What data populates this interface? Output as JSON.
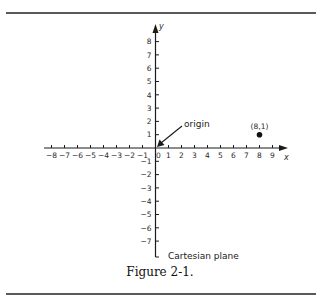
{
  "chart_data": {
    "type": "scatter",
    "title": "Cartesian plane",
    "caption": "Figure 2-1.",
    "xlabel": "x",
    "ylabel": "y",
    "xlim": [
      -8,
      9
    ],
    "ylim": [
      -8,
      8
    ],
    "x_ticks": [
      -8,
      -7,
      -6,
      -5,
      -4,
      -3,
      -2,
      -1,
      0,
      1,
      2,
      3,
      4,
      5,
      6,
      7,
      8,
      9
    ],
    "y_ticks": [
      -7,
      -6,
      -5,
      -4,
      -3,
      -2,
      -1,
      1,
      2,
      3,
      4,
      5,
      6,
      7,
      8
    ],
    "grid": false,
    "points": [
      {
        "x": 8,
        "y": 1,
        "label": "(8,1)"
      }
    ],
    "annotations": [
      {
        "text": "origin",
        "points_to": [
          0,
          0
        ]
      }
    ]
  },
  "labels": {
    "x_axis": "x",
    "y_axis": "y",
    "origin": "origin",
    "point": "(8,1)",
    "plane": "Cartesian plane",
    "caption": "Figure 2-1."
  },
  "colors": {
    "ink": "#1a1a1a",
    "rule": "#222222",
    "background": "#ffffff"
  }
}
